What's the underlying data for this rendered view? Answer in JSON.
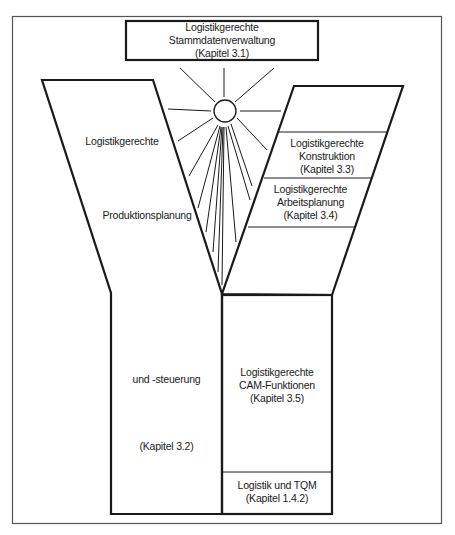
{
  "diagram": {
    "type": "Y-Modell (logistikgerechte Gestaltung)",
    "top_box": {
      "lines": [
        "Logistikgerechte",
        "Stammdatenverwaltung",
        "(Kapitel 3.1)"
      ]
    },
    "left_branch": {
      "line1": "Logistikgerechte",
      "line2": "Produktionsplanung",
      "line3": "und -steuerung",
      "line4": "(Kapitel 3.2)"
    },
    "right_branch": {
      "sections": [
        {
          "lines": [
            "Logistikgerechte",
            "Konstruktion",
            "(Kapitel 3.3)"
          ]
        },
        {
          "lines": [
            "Logistikgerechte",
            "Arbeitsplanung",
            "(Kapitel 3.4)"
          ]
        }
      ]
    },
    "right_stem": {
      "sections": [
        {
          "lines": [
            "Logistikgerechte",
            "CAM-Funktionen",
            "(Kapitel 3.5)"
          ]
        },
        {
          "lines": [
            "Logistik und TQM",
            "(Kapitel 1.4.2)"
          ]
        }
      ]
    },
    "sun_icon": "sun-icon",
    "colors": {
      "stroke": "#1a1a1a",
      "frame": "#555555",
      "background": "#ffffff"
    }
  }
}
